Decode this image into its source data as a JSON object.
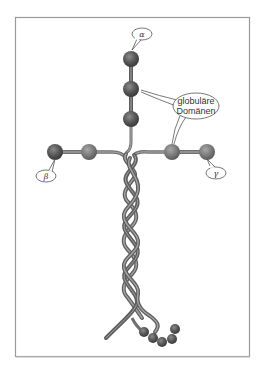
{
  "diagram": {
    "labels": {
      "alpha": "α",
      "beta": "β",
      "gamma": "γ",
      "globular_line1": "globuläre",
      "globular_line2": "Domänen"
    },
    "colors": {
      "frame": "#9a9a9a",
      "bead_dark": "#4a4a4a",
      "bead_mid": "#6e6e6e",
      "strand": "#6f6f6f",
      "strand_light": "#a8a8a8",
      "bubble_stroke": "#555555",
      "background": "#ffffff"
    }
  }
}
